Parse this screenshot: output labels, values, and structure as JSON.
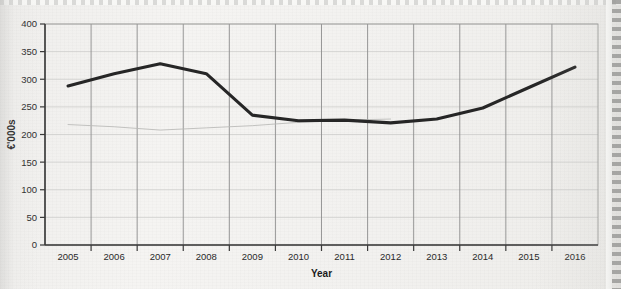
{
  "chart_data": {
    "type": "line",
    "title": "",
    "xlabel": "Year",
    "ylabel": "€'000s",
    "categories": [
      "2005",
      "2006",
      "2007",
      "2008",
      "2009",
      "2010",
      "2011",
      "2012",
      "2013",
      "2014",
      "2015",
      "2016"
    ],
    "series": [
      {
        "name": "main",
        "values": [
          288,
          310,
          328,
          310,
          235,
          225,
          226,
          221,
          228,
          248,
          285,
          322
        ],
        "color": "#262626",
        "style": "solid-thick"
      },
      {
        "name": "faint-showthrough",
        "values": [
          218,
          214,
          208,
          212,
          216,
          222,
          226,
          228,
          null,
          null,
          null,
          null
        ],
        "color": "#b8b8b6",
        "style": "faint-thin"
      }
    ],
    "ylim": [
      0,
      400
    ],
    "yticks": [
      0,
      50,
      100,
      150,
      200,
      250,
      300,
      350,
      400
    ],
    "ytick_labels": [
      "0",
      "50",
      "100",
      "150",
      "200",
      "250",
      "300",
      "350",
      "400"
    ],
    "grid": {
      "vertical": true,
      "horizontal": true
    },
    "legend": {
      "visible": false,
      "position": "none"
    }
  },
  "axes": {
    "y_title": "€'000s",
    "x_title": "Year"
  },
  "page": {
    "edge": "perforated-right"
  }
}
